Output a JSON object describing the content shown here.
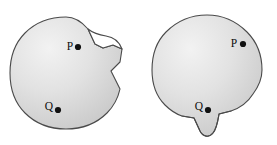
{
  "figure": {
    "canvas": {
      "width": 277,
      "height": 145
    },
    "background_color": "#ffffff",
    "outline_color": "#4a4a4a",
    "fill_light_color": "#f0f0f0",
    "fill_mid_color": "#dcdcdc",
    "fill_dark_color": "#bfbfbf",
    "point_color": "#111111",
    "label_color": "#0d0d0d"
  },
  "shapes": [
    {
      "id": "left-region",
      "name": "left-region",
      "description": "disk with an outward cusp notch on the upper right boundary",
      "center": {
        "cx": 66,
        "cy": 73
      },
      "radius": 56,
      "feature": "upper-right cusp",
      "outline": "M 66 17 C 51 17 36 22 25 33 C 14 44 10 59 10 73 C 10 87 14 102 25 113 C 36 124 51 129 66 129 C 81 129 96 124 107 113 C 114 106 118 98 120 89 L 111 71 L 120 62 L 122 49 L 113 45 L 103 48 L 95 44 L 88 29 C 82 22 74 17 66 17 Z",
      "notch": "M 88 29 C 93 33 99 35 106 36 C 113 37 119 41 122 49 L 113 45 L 103 48 L 95 44 Z",
      "points": [
        {
          "id": "P",
          "label": "P",
          "dot": {
            "x": 78,
            "y": 47
          },
          "label_pos": {
            "x": 70,
            "y": 46
          }
        },
        {
          "id": "Q",
          "label": "Q",
          "dot": {
            "x": 58,
            "y": 110
          },
          "label_pos": {
            "x": 49,
            "y": 107
          }
        }
      ]
    },
    {
      "id": "right-region",
      "name": "right-region",
      "description": "disk with a downward teardrop cusp on the lower boundary",
      "center": {
        "cx": 207,
        "cy": 70
      },
      "radius": 55,
      "feature": "bottom teardrop cusp",
      "outline": "M 207 15 C 192 15 177 21 166 32 C 155 43 152 57 152 70 C 152 83 156 96 165 105 C 170 110 176 114 182 116 L 194 118 L 200 131 C 203 137 209 138 213 133 C 217 128 218 120 219 114 L 231 111 C 240 108 248 102 253 94 C 259 86 262 78 262 70 C 262 57 258 43 247 32 C 236 21 222 15 207 15 Z",
      "notch": "M 182 116 L 194 118 L 200 131 C 203 137 209 138 213 133 C 217 128 218 120 219 114 L 231 111",
      "points": [
        {
          "id": "P",
          "label": "P",
          "dot": {
            "x": 243,
            "y": 44
          },
          "label_pos": {
            "x": 234,
            "y": 43
          }
        },
        {
          "id": "Q",
          "label": "Q",
          "dot": {
            "x": 208,
            "y": 110
          },
          "label_pos": {
            "x": 199,
            "y": 107
          }
        }
      ]
    }
  ]
}
